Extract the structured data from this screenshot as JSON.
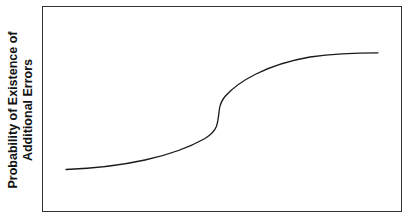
{
  "figure": {
    "width": 413,
    "height": 219,
    "background_color": "#ffffff"
  },
  "axis_label": {
    "line1": "Probability of Existence of",
    "line2": "Additional Errors",
    "orientation": "vertical-rotated-90-ccw",
    "bold": true,
    "color": "#121212"
  },
  "chart_data": {
    "type": "line",
    "title": "",
    "subtitle": "",
    "xlabel": "",
    "ylabel": "Probability of Existence of Additional Errors",
    "tick_labels": {
      "x": [],
      "y": []
    },
    "grid": false,
    "legend": null,
    "annotations": [],
    "axis_ranges": {
      "xlim": [
        0,
        1
      ],
      "ylim": [
        0,
        1
      ]
    },
    "series": [
      {
        "name": "Probability of existence of additional errors",
        "color": "#1a1a1a",
        "line_width": 1.3,
        "x": [
          0.0,
          0.04,
          0.09,
          0.14,
          0.19,
          0.24,
          0.29,
          0.34,
          0.38,
          0.42,
          0.45,
          0.47,
          0.48,
          0.485,
          0.49,
          0.5,
          0.515,
          0.53,
          0.56,
          0.6,
          0.65,
          0.7,
          0.76,
          0.82,
          0.88,
          0.94,
          1.0
        ],
        "y": [
          0.175,
          0.182,
          0.196,
          0.215,
          0.24,
          0.27,
          0.305,
          0.345,
          0.385,
          0.425,
          0.455,
          0.48,
          0.51,
          0.56,
          0.615,
          0.66,
          0.69,
          0.712,
          0.748,
          0.79,
          0.832,
          0.864,
          0.893,
          0.914,
          0.93,
          0.94,
          0.945
        ]
      }
    ],
    "pixel_path": {
      "start": [
        66,
        169
      ],
      "inflection": [
        219,
        118
      ],
      "end": [
        378,
        53
      ],
      "svg_d": "M 66,169.5 C 92,168.5 120,165.5 145,160.0 C 168,155.0 190,147.0 205,138.5 C 211,134.8 214.6,131.0 216.4,126.5 C 218.2,121.5 218.6,115.0 219.4,109.0 C 220.2,104.0 222.0,100.0 225.4,96.0 C 233,87.5 244,80.0 256,74.0 C 272,66.0 290,60.5 310,57.0 C 333,53.8 358,52.8 378,52.8"
    }
  }
}
